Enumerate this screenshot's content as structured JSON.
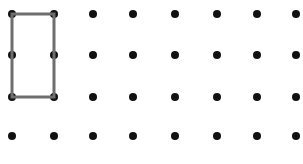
{
  "canvas": {
    "width": 303,
    "height": 164,
    "background_color": "#ffffff",
    "title": "Dot grid with rectangle"
  },
  "grid": {
    "columns": 8,
    "rows": 4,
    "dot_color": "#111111",
    "dot_diameter": 8,
    "column_x": [
      12,
      54,
      93,
      133,
      175,
      217,
      257,
      296
    ],
    "row_y": [
      14,
      55,
      97,
      136
    ],
    "column_spacing": 40.6,
    "row_spacing": 40.7
  },
  "shapes": [
    {
      "name": "rectangle",
      "type": "rectangle",
      "stroke_color": "#6e6e6e",
      "stroke_width": 3,
      "fill": "none",
      "vertices_grid": [
        {
          "col": 0,
          "row": 0
        },
        {
          "col": 1,
          "row": 0
        },
        {
          "col": 1,
          "row": 2
        },
        {
          "col": 0,
          "row": 2
        }
      ],
      "vertices_px": [
        {
          "x": 12,
          "y": 14
        },
        {
          "x": 54,
          "y": 14
        },
        {
          "x": 54,
          "y": 97
        },
        {
          "x": 12,
          "y": 97
        }
      ],
      "width_px": 42,
      "height_px": 83,
      "width_units": 1,
      "height_units": 2
    }
  ],
  "chart_data": {
    "type": "scatter",
    "xlabel": "",
    "ylabel": "",
    "grid": true,
    "legend": "none",
    "xlim": [
      0,
      7
    ],
    "ylim": [
      0,
      3
    ],
    "categories": [
      "col1",
      "col2",
      "col3",
      "col4",
      "col5",
      "col6",
      "col7",
      "col8"
    ],
    "points": [
      {
        "col": 0,
        "row": 0,
        "x": 12,
        "y": 14
      },
      {
        "col": 1,
        "row": 0,
        "x": 54,
        "y": 14
      },
      {
        "col": 2,
        "row": 0,
        "x": 93,
        "y": 14
      },
      {
        "col": 3,
        "row": 0,
        "x": 133,
        "y": 14
      },
      {
        "col": 4,
        "row": 0,
        "x": 175,
        "y": 14
      },
      {
        "col": 5,
        "row": 0,
        "x": 217,
        "y": 14
      },
      {
        "col": 6,
        "row": 0,
        "x": 257,
        "y": 14
      },
      {
        "col": 7,
        "row": 0,
        "x": 296,
        "y": 14
      },
      {
        "col": 0,
        "row": 1,
        "x": 12,
        "y": 55
      },
      {
        "col": 1,
        "row": 1,
        "x": 54,
        "y": 55
      },
      {
        "col": 2,
        "row": 1,
        "x": 93,
        "y": 55
      },
      {
        "col": 3,
        "row": 1,
        "x": 133,
        "y": 55
      },
      {
        "col": 4,
        "row": 1,
        "x": 175,
        "y": 55
      },
      {
        "col": 5,
        "row": 1,
        "x": 217,
        "y": 55
      },
      {
        "col": 6,
        "row": 1,
        "x": 257,
        "y": 55
      },
      {
        "col": 7,
        "row": 1,
        "x": 296,
        "y": 55
      },
      {
        "col": 0,
        "row": 2,
        "x": 12,
        "y": 97
      },
      {
        "col": 1,
        "row": 2,
        "x": 54,
        "y": 97
      },
      {
        "col": 2,
        "row": 2,
        "x": 93,
        "y": 97
      },
      {
        "col": 3,
        "row": 2,
        "x": 133,
        "y": 97
      },
      {
        "col": 4,
        "row": 2,
        "x": 175,
        "y": 97
      },
      {
        "col": 5,
        "row": 2,
        "x": 217,
        "y": 97
      },
      {
        "col": 6,
        "row": 2,
        "x": 257,
        "y": 97
      },
      {
        "col": 7,
        "row": 2,
        "x": 296,
        "y": 97
      },
      {
        "col": 0,
        "row": 3,
        "x": 12,
        "y": 136
      },
      {
        "col": 1,
        "row": 3,
        "x": 54,
        "y": 136
      },
      {
        "col": 2,
        "row": 3,
        "x": 93,
        "y": 136
      },
      {
        "col": 3,
        "row": 3,
        "x": 133,
        "y": 136
      },
      {
        "col": 4,
        "row": 3,
        "x": 175,
        "y": 136
      },
      {
        "col": 5,
        "row": 3,
        "x": 217,
        "y": 136
      },
      {
        "col": 6,
        "row": 3,
        "x": 257,
        "y": 136
      },
      {
        "col": 7,
        "row": 3,
        "x": 296,
        "y": 136
      }
    ]
  }
}
